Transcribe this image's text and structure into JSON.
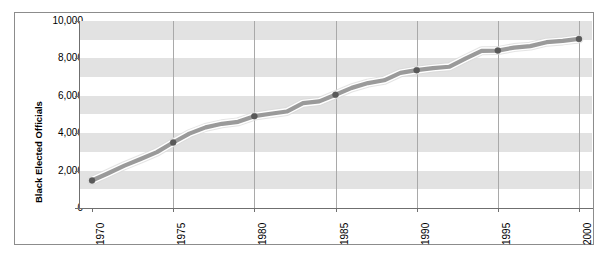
{
  "chart_data": {
    "type": "line",
    "title": "",
    "xlabel": "",
    "ylabel": "Black Elected Officials",
    "ylim": [
      0,
      10000
    ],
    "xlim": [
      1970,
      2000
    ],
    "grid": "horizontal-bands-and-vertical-gridlines",
    "legend": "none",
    "y_ticks": [
      "0",
      "2,000",
      "4,000",
      "6,000",
      "8,000",
      "10,000"
    ],
    "y_tick_values": [
      0,
      2000,
      4000,
      6000,
      8000,
      10000
    ],
    "x_ticks": [
      "1970",
      "1975",
      "1980",
      "1985",
      "1990",
      "1995",
      "2000"
    ],
    "x_tick_values": [
      1970,
      1975,
      1980,
      1985,
      1990,
      1995,
      2000
    ],
    "marker_years": [
      1970,
      1975,
      1980,
      1985,
      1990,
      1995,
      2000
    ],
    "marker_values": [
      1469,
      3503,
      4912,
      6056,
      7370,
      8419,
      9040
    ],
    "series": [
      {
        "name": "Black Elected Officials",
        "x": [
          1970,
          1971,
          1972,
          1973,
          1974,
          1975,
          1976,
          1977,
          1978,
          1979,
          1980,
          1981,
          1982,
          1983,
          1984,
          1985,
          1986,
          1987,
          1988,
          1989,
          1990,
          1991,
          1992,
          1993,
          1994,
          1995,
          1996,
          1997,
          1998,
          1999,
          2000
        ],
        "values": [
          1469,
          1860,
          2264,
          2621,
          2991,
          3503,
          3979,
          4311,
          4503,
          4607,
          4912,
          5038,
          5160,
          5606,
          5700,
          6056,
          6424,
          6681,
          6829,
          7226,
          7370,
          7480,
          7552,
          7984,
          8406,
          8419,
          8579,
          8656,
          8868,
          8936,
          9040
        ]
      }
    ],
    "colors": {
      "line": "#9a9a9a",
      "line_highlight": "#ffffff",
      "marker": "#595959",
      "band": "#e2e2e2",
      "gridline": "#a9a9a9",
      "axis": "#6f6f6f",
      "frame": "#8c8c8c",
      "text": "#000000",
      "background": "#ffffff"
    }
  }
}
